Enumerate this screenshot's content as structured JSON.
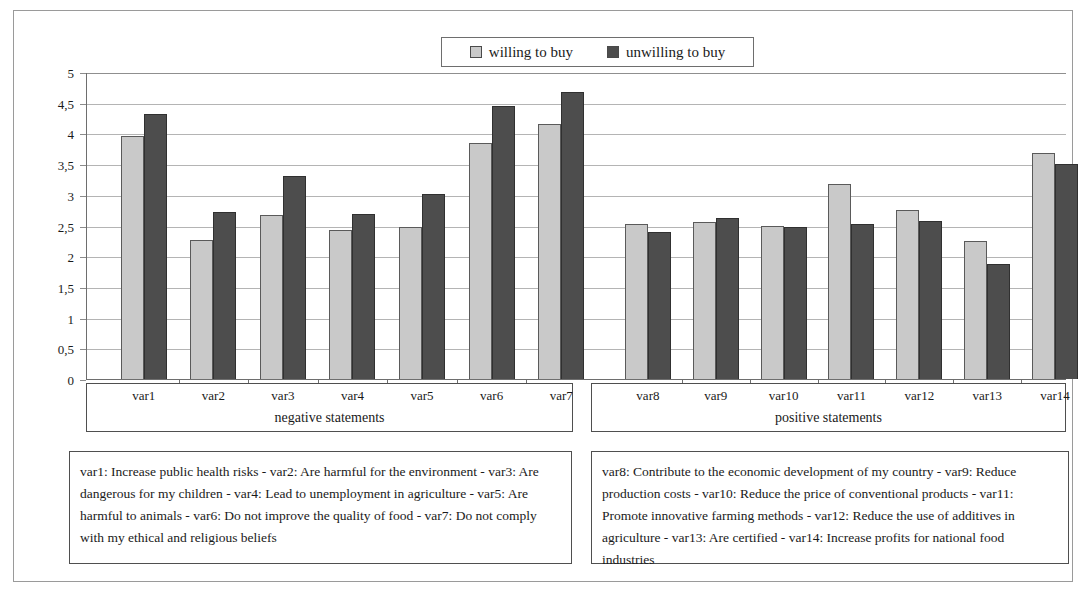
{
  "legend": {
    "entries": [
      {
        "label": "willing to buy",
        "swatch": "light",
        "color": "#c9c9c9"
      },
      {
        "label": "unwilling to buy",
        "swatch": "dark",
        "color": "#4d4d4d"
      }
    ]
  },
  "axis": {
    "y_ticks": [
      "0",
      "0,5",
      "1",
      "1,5",
      "2",
      "2,5",
      "3",
      "3,5",
      "4",
      "4,5",
      "5"
    ]
  },
  "groups": [
    {
      "title": "negative statements",
      "categories": [
        "var1",
        "var2",
        "var3",
        "var4",
        "var5",
        "var6",
        "var7"
      ]
    },
    {
      "title": "positive statements",
      "categories": [
        "var8",
        "var9",
        "var10",
        "var11",
        "var12",
        "var13",
        "var14"
      ]
    }
  ],
  "descriptions": {
    "negative": "var1: Increase public health risks - var2: Are harmful for the environment - var3: Are dangerous for my children - var4: Lead to unemployment in agriculture - var5: Are harmful to animals - var6: Do not improve the quality of food - var7: Do not comply with my ethical and religious beliefs",
    "positive": "var8: Contribute to the economic development of my country - var9: Reduce production costs - var10: Reduce the price of conventional products - var11: Promote innovative farming methods - var12: Reduce the use of additives in agriculture - var13: Are certified - var14: Increase profits for national food industries"
  },
  "chart_data": {
    "type": "bar",
    "title": "",
    "xlabel": "",
    "ylabel": "",
    "ylim": [
      0,
      5
    ],
    "ytick_step": 0.5,
    "grid": true,
    "legend_position": "top-center",
    "categories": [
      "var1",
      "var2",
      "var3",
      "var4",
      "var5",
      "var6",
      "var7",
      "var8",
      "var9",
      "var10",
      "var11",
      "var12",
      "var13",
      "var14"
    ],
    "series": [
      {
        "name": "willing to buy",
        "color": "#c9c9c9",
        "values": [
          3.95,
          2.26,
          2.67,
          2.42,
          2.48,
          3.85,
          4.15,
          2.52,
          2.55,
          2.5,
          3.18,
          2.75,
          2.24,
          3.68
        ]
      },
      {
        "name": "unwilling to buy",
        "color": "#4d4d4d",
        "values": [
          4.32,
          2.72,
          3.3,
          2.68,
          3.02,
          4.45,
          4.68,
          2.4,
          2.62,
          2.48,
          2.52,
          2.57,
          1.87,
          3.5
        ]
      }
    ]
  }
}
